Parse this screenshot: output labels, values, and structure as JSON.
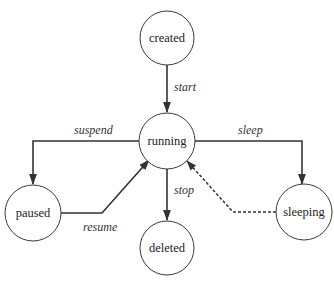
{
  "diagram": {
    "type": "state-transition",
    "nodes": {
      "created": {
        "label": "created"
      },
      "running": {
        "label": "running"
      },
      "paused": {
        "label": "paused"
      },
      "deleted": {
        "label": "deleted"
      },
      "sleeping": {
        "label": "sleeping"
      }
    },
    "edges": {
      "start": {
        "label": "start",
        "from": "created",
        "to": "running",
        "style": "solid"
      },
      "suspend": {
        "label": "suspend",
        "from": "running",
        "to": "paused",
        "style": "solid"
      },
      "resume": {
        "label": "resume",
        "from": "paused",
        "to": "running",
        "style": "solid"
      },
      "stop": {
        "label": "stop",
        "from": "running",
        "to": "deleted",
        "style": "solid"
      },
      "sleep": {
        "label": "sleep",
        "from": "running",
        "to": "sleeping",
        "style": "solid"
      },
      "wake": {
        "label": "",
        "from": "sleeping",
        "to": "running",
        "style": "dashed"
      }
    },
    "colors": {
      "stroke": "#333333",
      "background": "#ffffff",
      "text": "#222222"
    }
  }
}
